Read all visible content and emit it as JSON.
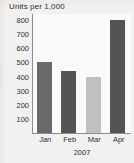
{
  "chart_data": {
    "type": "bar",
    "title": "Units per 1,000",
    "xlabel": "2007",
    "ylabel": "",
    "categories": [
      "Jan",
      "Feb",
      "Mar",
      "Apr"
    ],
    "values": [
      500,
      440,
      400,
      800
    ],
    "ylim": [
      0,
      850
    ],
    "yticks": [
      100,
      200,
      300,
      400,
      500,
      600,
      700,
      800
    ],
    "ytick_labels": [
      "100",
      "200",
      "300",
      "400",
      "500",
      "600",
      "700",
      "800"
    ],
    "grid": false,
    "legend": false,
    "bar_colors": [
      "#6a6a6a",
      "#545454",
      "#c0c0c0",
      "#545454"
    ],
    "series": [
      {
        "name": "Units per 1,000",
        "values": [
          500,
          440,
          400,
          800
        ]
      }
    ]
  },
  "colors": {
    "background": "#f3f1ef",
    "plot_background": "#fbfafa",
    "axis": "#8d8d8d",
    "text": "#2e2e2e"
  }
}
